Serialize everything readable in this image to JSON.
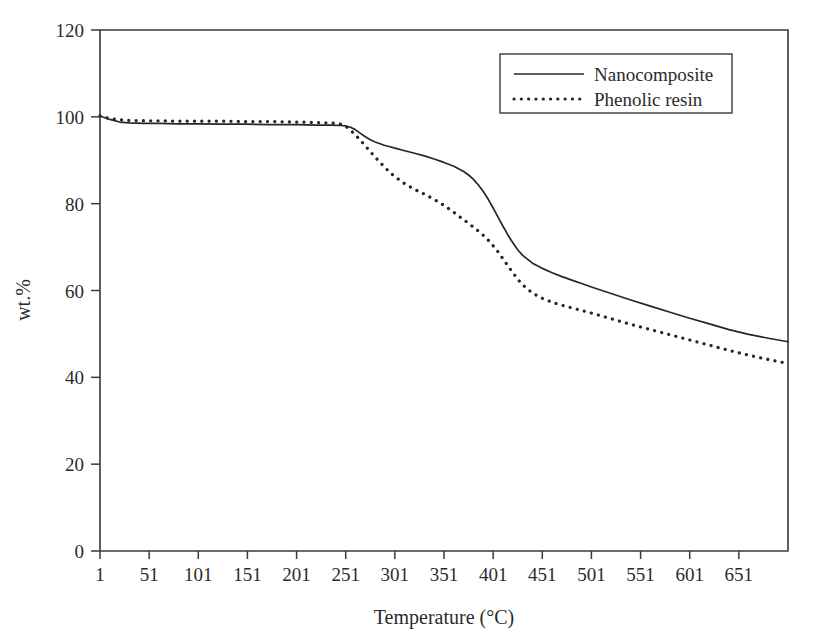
{
  "chart_data": {
    "type": "line",
    "title": "",
    "xlabel": "Temperature (°C)",
    "ylabel": "wt.%",
    "xlim": [
      1,
      701
    ],
    "ylim": [
      0,
      120
    ],
    "grid": false,
    "legend_position": "top-right",
    "xticks": [
      1,
      51,
      101,
      151,
      201,
      251,
      301,
      351,
      401,
      451,
      501,
      551,
      601,
      651
    ],
    "xtick_labels": [
      "1",
      "51",
      "101",
      "151",
      "201",
      "251",
      "301",
      "351",
      "401",
      "451",
      "501",
      "551",
      "601",
      "651"
    ],
    "yticks": [
      0,
      20,
      40,
      60,
      80,
      100,
      120
    ],
    "ytick_labels": [
      "0",
      "20",
      "40",
      "60",
      "80",
      "100",
      "120"
    ],
    "series": [
      {
        "name": "Nanocomposite",
        "style": "solid",
        "color": "#262626",
        "x": [
          1,
          11,
          21,
          31,
          46,
          61,
          81,
          101,
          126,
          151,
          176,
          201,
          221,
          236,
          246,
          251,
          256,
          261,
          266,
          271,
          276,
          281,
          286,
          291,
          296,
          301,
          311,
          321,
          331,
          341,
          351,
          361,
          371,
          376,
          381,
          386,
          391,
          396,
          401,
          406,
          411,
          416,
          421,
          426,
          431,
          441,
          451,
          461,
          471,
          481,
          491,
          501,
          521,
          541,
          561,
          581,
          601,
          621,
          641,
          661,
          681,
          701
        ],
        "y": [
          100.2,
          99.4,
          98.8,
          98.6,
          98.5,
          98.5,
          98.4,
          98.4,
          98.3,
          98.3,
          98.2,
          98.2,
          98.1,
          98.1,
          98.0,
          97.9,
          97.6,
          97.0,
          96.2,
          95.4,
          94.7,
          94.2,
          93.8,
          93.4,
          93.1,
          92.8,
          92.2,
          91.6,
          91.0,
          90.3,
          89.5,
          88.6,
          87.4,
          86.6,
          85.6,
          84.3,
          82.8,
          81.0,
          79.0,
          76.9,
          74.8,
          72.8,
          71.0,
          69.4,
          68.1,
          66.3,
          65.1,
          64.1,
          63.2,
          62.4,
          61.6,
          60.8,
          59.3,
          57.8,
          56.4,
          55.0,
          53.6,
          52.3,
          51.0,
          49.9,
          49.0,
          48.2
        ]
      },
      {
        "name": "Phenolic resin",
        "style": "dotted",
        "color": "#262626",
        "x": [
          1,
          11,
          21,
          31,
          46,
          61,
          81,
          101,
          126,
          151,
          176,
          201,
          221,
          236,
          246,
          251,
          256,
          261,
          266,
          271,
          276,
          281,
          286,
          291,
          296,
          301,
          311,
          321,
          331,
          341,
          351,
          361,
          371,
          381,
          391,
          396,
          401,
          406,
          411,
          416,
          421,
          426,
          431,
          441,
          451,
          461,
          471,
          481,
          491,
          501,
          521,
          541,
          561,
          581,
          601,
          621,
          641,
          661,
          681,
          701
        ],
        "y": [
          100.2,
          99.6,
          99.3,
          99.2,
          99.1,
          99.1,
          99.0,
          99.0,
          99.0,
          98.9,
          98.9,
          98.8,
          98.7,
          98.6,
          98.3,
          97.8,
          96.9,
          95.8,
          94.6,
          93.3,
          92.0,
          90.7,
          89.5,
          88.3,
          87.2,
          86.2,
          84.6,
          83.3,
          82.2,
          81.0,
          79.6,
          78.0,
          76.3,
          74.6,
          72.7,
          71.6,
          70.3,
          68.9,
          67.3,
          65.7,
          64.1,
          62.6,
          61.3,
          59.4,
          58.2,
          57.3,
          56.6,
          56.0,
          55.4,
          54.8,
          53.5,
          52.2,
          51.0,
          49.8,
          48.6,
          47.4,
          46.2,
          45.1,
          44.1,
          43.2
        ]
      }
    ]
  },
  "legend": {
    "entries": [
      {
        "label": "Nanocomposite",
        "style": "solid"
      },
      {
        "label": "Phenolic resin",
        "style": "dotted"
      }
    ]
  },
  "axes": {
    "x_title": "Temperature (°C)",
    "y_title": "wt.%"
  }
}
